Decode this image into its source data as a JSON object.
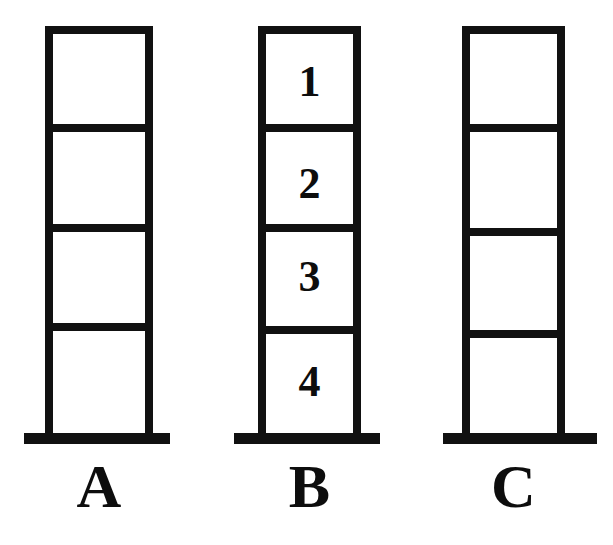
{
  "figure": {
    "title": "",
    "background_color": "#ffffff",
    "ink_color": "#111111",
    "stacks": [
      {
        "id": "a",
        "label": "A",
        "block_count": 4,
        "numbered": false,
        "blocks": [
          "",
          "",
          "",
          ""
        ]
      },
      {
        "id": "b",
        "label": "B",
        "block_count": 4,
        "numbered": true,
        "blocks": [
          "1",
          "2",
          "3",
          "4"
        ]
      },
      {
        "id": "c",
        "label": "C",
        "block_count": 4,
        "numbered": false,
        "blocks": [
          "",
          "",
          "",
          ""
        ]
      }
    ]
  },
  "labels": {
    "stack_a": "A",
    "stack_b": "B",
    "stack_c": "C"
  },
  "numbers": {
    "block_1": "1",
    "block_2": "2",
    "block_3": "3",
    "block_4": "4"
  }
}
